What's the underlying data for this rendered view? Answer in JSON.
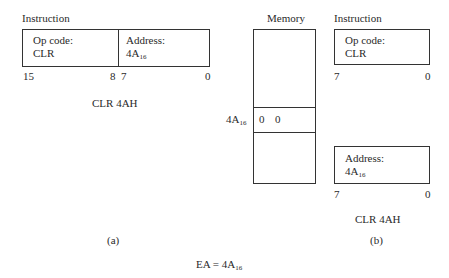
{
  "panel_a": {
    "title": "Instruction",
    "opcode_label": "Op code:",
    "opcode_value": "CLR",
    "address_label": "Address:",
    "address_value": "4A",
    "address_sub": "16",
    "bit_labels": {
      "b15": "15",
      "b8": "8",
      "b7": "7",
      "b0": "0"
    },
    "caption": "CLR 4AH",
    "panel_label": "(a)"
  },
  "memory": {
    "title": "Memory",
    "row_address": "4A",
    "row_address_sub": "16",
    "row_values": [
      "0",
      "0"
    ]
  },
  "panel_b": {
    "title": "Instruction",
    "opcode_label": "Op code:",
    "opcode_value": "CLR",
    "top_bits": {
      "high": "7",
      "low": "0"
    },
    "address_label": "Address:",
    "address_value": "4A",
    "address_sub": "16",
    "bottom_bits": {
      "high": "7",
      "low": "0"
    },
    "caption": "CLR 4AH",
    "panel_label": "(b)"
  },
  "footer": {
    "ea_text": "EA = 4A",
    "ea_sub": "16"
  }
}
